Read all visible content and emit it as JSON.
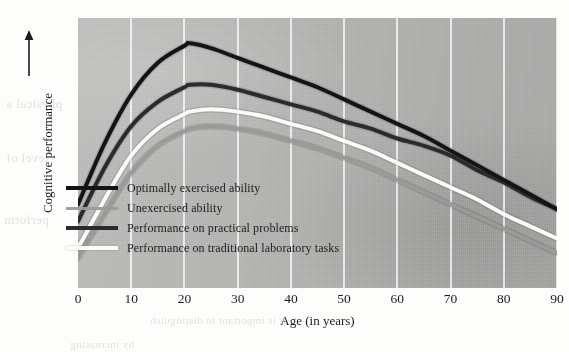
{
  "figure": {
    "kind": "scanned-book-figure",
    "background_color": "#b5b5b3",
    "page_color": "#fdfdfc"
  },
  "axes": {
    "x_title": "Age (in years)",
    "y_title": "Cognitive performance",
    "y_arrow_icon": "up-arrow-icon",
    "x_ticks": [
      "0",
      "10",
      "20",
      "30",
      "40",
      "50",
      "60",
      "70",
      "80",
      "90"
    ]
  },
  "legend": {
    "items": [
      {
        "label": "Optimally exercised ability",
        "color": "#141414",
        "swatch": "legend-swatch-optimally-exercised"
      },
      {
        "label": "Unexercised ability",
        "color": "#9a9a98",
        "swatch": "legend-swatch-unexercised"
      },
      {
        "label": "Performance on practical problems",
        "color": "#2b2b2b",
        "swatch": "legend-swatch-practical-problems"
      },
      {
        "label": "Performance on traditional laboratory tasks",
        "color": "#fbfbfa",
        "swatch": "legend-swatch-laboratory-tasks"
      }
    ]
  },
  "bleed_text": [
    {
      "text": "physical a",
      "left": 6,
      "top": 96,
      "size": 13
    },
    {
      "text": "level of",
      "left": 6,
      "top": 150,
      "size": 13
    },
    {
      "text": "perform",
      "left": 4,
      "top": 212,
      "size": 13
    },
    {
      "text": "in the",
      "left": 488,
      "top": 96,
      "size": 12
    },
    {
      "text": "tasks",
      "left": 498,
      "top": 152,
      "size": 12
    },
    {
      "text": "the",
      "left": 516,
      "top": 206,
      "size": 12
    },
    {
      "text": "it is important to distinguish",
      "left": 150,
      "top": 314,
      "size": 11
    },
    {
      "text": "by increasing",
      "left": 70,
      "top": 338,
      "size": 11
    }
  ],
  "chart_data": {
    "type": "line",
    "title": "",
    "subtitle": "",
    "xlabel": "Age (in years)",
    "ylabel": "Cognitive performance",
    "xlim": [
      0,
      90
    ],
    "ylim": [
      0,
      100
    ],
    "x_ticks": [
      0,
      10,
      20,
      30,
      40,
      50,
      60,
      70,
      80,
      90
    ],
    "y_ticks": [],
    "grid": "vertical-white-gridlines",
    "legend_position": "inside-lower-left",
    "x": [
      0,
      5,
      10,
      15,
      20,
      21,
      25,
      30,
      35,
      40,
      45,
      50,
      55,
      60,
      65,
      70,
      75,
      80,
      85,
      90
    ],
    "series": [
      {
        "name": "Optimally exercised ability",
        "color": "#141414",
        "peak_age": 21,
        "values": [
          31,
          56,
          76,
          89,
          96,
          97,
          95,
          91,
          87,
          83,
          79,
          74,
          69,
          64,
          59,
          53,
          47,
          41,
          35,
          29
        ]
      },
      {
        "name": "Performance on practical problems",
        "color": "#2b2b2b",
        "peak_age": 23,
        "values": [
          24,
          46,
          63,
          73,
          79,
          80,
          80,
          78,
          75,
          72,
          69,
          65,
          62,
          58,
          55,
          51,
          45,
          40,
          34,
          29
        ]
      },
      {
        "name": "Performance on traditional laboratory tasks",
        "color": "#fbfbfa",
        "peak_age": 24,
        "values": [
          13,
          33,
          51,
          62,
          68,
          69,
          70,
          69,
          67,
          64,
          61,
          57,
          53,
          48,
          43,
          38,
          33,
          27,
          22,
          17
        ]
      },
      {
        "name": "Unexercised ability",
        "color": "#9a9a98",
        "peak_age": 25,
        "values": [
          9,
          27,
          44,
          55,
          61,
          62,
          63,
          62,
          60,
          57,
          54,
          50,
          46,
          41,
          36,
          31,
          26,
          21,
          16,
          11
        ]
      }
    ]
  }
}
